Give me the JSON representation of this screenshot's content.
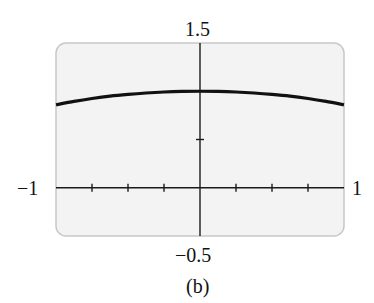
{
  "chart_data": {
    "type": "line",
    "title": "",
    "caption": "(b)",
    "xlabel": "",
    "ylabel": "",
    "xlim": [
      -1,
      1
    ],
    "ylim": [
      -0.5,
      1.5
    ],
    "x_tick_step": 0.25,
    "y_tick_step": 0.5,
    "tick_labels": {
      "x_min": "−1",
      "x_max": "1",
      "y_min": "−0.5",
      "y_max": "1.5"
    },
    "grid": false,
    "legend": null,
    "series": [
      {
        "name": "f(x)",
        "x": [
          -1,
          -0.875,
          -0.75,
          -0.625,
          -0.5,
          -0.375,
          -0.25,
          -0.125,
          0,
          0.125,
          0.25,
          0.375,
          0.5,
          0.625,
          0.75,
          0.875,
          1
        ],
        "y": [
          0.86,
          0.895,
          0.925,
          0.95,
          0.968,
          0.982,
          0.992,
          0.998,
          1.0,
          0.998,
          0.992,
          0.982,
          0.968,
          0.95,
          0.925,
          0.895,
          0.86
        ]
      }
    ]
  },
  "style": {
    "panel_fill": "#f3f3f3",
    "panel_border": "#c8c8c8",
    "axis_color": "#1a1a1a",
    "curve_color": "#111111"
  }
}
